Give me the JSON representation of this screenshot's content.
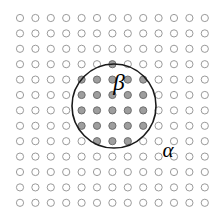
{
  "figure": {
    "name": "lattice-cluster-diagram",
    "background_color": "#ffffff",
    "width": 223,
    "height": 222
  },
  "labels": {
    "alpha": "α",
    "beta": "β",
    "alpha_name": "alpha",
    "beta_name": "beta"
  },
  "chart_data": {
    "type": "scatter",
    "title": "",
    "subtitle": "",
    "xlabel": "",
    "ylabel": "",
    "grid": false,
    "legend_position": "none",
    "annotations": [
      {
        "text": "β",
        "x": 119,
        "y": 90,
        "role": "inner-region-label"
      },
      {
        "text": "α",
        "x": 168,
        "y": 157,
        "role": "radius-label"
      }
    ],
    "lattice": {
      "description": "Square lattice of sites; 13 columns by 13 rows",
      "columns": 13,
      "rows": 13,
      "x_start": 20,
      "y_start": 18,
      "spacing_x": 15.4,
      "spacing_y": 15.4,
      "site_radius": 3.6,
      "open_fill": "#ffffff",
      "open_stroke": "#9a9a9a",
      "filled_fill": "#9e9e9e",
      "filled_stroke": "#6e6e6e"
    },
    "cluster_circle": {
      "center_x": 114,
      "center_y": 106,
      "radius": 42,
      "stroke": "#1a1a1a",
      "stroke_width": 1.6,
      "fill": "none"
    },
    "series": [
      {
        "name": "sites-inside-cluster",
        "state": "filled",
        "count": 37,
        "points": [
          [
            97,
            75
          ],
          [
            112,
            75
          ],
          [
            128,
            75
          ],
          [
            82,
            90
          ],
          [
            97,
            90
          ],
          [
            112,
            90
          ],
          [
            128,
            90
          ],
          [
            143,
            90
          ],
          [
            82,
            106
          ],
          [
            97,
            106
          ],
          [
            112,
            106
          ],
          [
            128,
            106
          ],
          [
            143,
            106
          ],
          [
            82,
            121
          ],
          [
            97,
            121
          ],
          [
            112,
            121
          ],
          [
            128,
            121
          ],
          [
            143,
            121
          ],
          [
            97,
            136
          ],
          [
            112,
            136
          ],
          [
            128,
            136
          ],
          [
            82,
            75
          ],
          [
            143,
            75
          ],
          [
            67,
            106
          ],
          [
            97,
            60
          ],
          [
            112,
            60
          ],
          [
            128,
            60
          ],
          [
            82,
            136
          ],
          [
            143,
            136
          ],
          [
            97,
            151
          ],
          [
            112,
            151
          ],
          [
            128,
            151
          ],
          [
            67,
            90
          ],
          [
            67,
            121
          ],
          [
            159,
            90
          ],
          [
            159,
            106
          ],
          [
            159,
            121
          ]
        ]
      },
      {
        "name": "sites-outside-cluster",
        "state": "open",
        "count": 132
      }
    ]
  }
}
